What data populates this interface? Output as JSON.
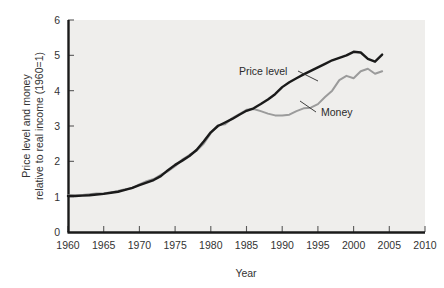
{
  "chart_data": {
    "type": "line",
    "title": "",
    "xlabel": "Year",
    "ylabel": "Price level and money relative to real income (1960=1)",
    "ylabel_line1": "Price level and money",
    "ylabel_line2": "relative to real income (1960=1)",
    "xlim": [
      1960,
      2010
    ],
    "ylim": [
      0,
      6
    ],
    "xticks": [
      1960,
      1965,
      1970,
      1975,
      1980,
      1985,
      1990,
      1995,
      2000,
      2005,
      2010
    ],
    "yticks": [
      0,
      1,
      2,
      3,
      4,
      5,
      6
    ],
    "xtick_labels": [
      "1960",
      "1965",
      "1970",
      "1975",
      "1980",
      "1985",
      "1990",
      "1995",
      "2000",
      "2005",
      "2010"
    ],
    "ytick_labels": [
      "0",
      "1",
      "2",
      "3",
      "4",
      "5",
      "6"
    ],
    "grid": false,
    "legend": "annotations",
    "plot_bgcolor": "#efeeec",
    "series": [
      {
        "name": "Price level",
        "color": "#1a1a1a",
        "x": [
          1960,
          1961,
          1962,
          1963,
          1964,
          1965,
          1966,
          1967,
          1968,
          1969,
          1970,
          1971,
          1972,
          1973,
          1974,
          1975,
          1976,
          1977,
          1978,
          1979,
          1980,
          1981,
          1982,
          1983,
          1984,
          1985,
          1986,
          1987,
          1988,
          1989,
          1990,
          1991,
          1992,
          1993,
          1994,
          1995,
          1996,
          1997,
          1998,
          1999,
          2000,
          2001,
          2002,
          2003,
          2004
        ],
        "values": [
          1.02,
          1.02,
          1.03,
          1.04,
          1.06,
          1.08,
          1.11,
          1.14,
          1.19,
          1.25,
          1.33,
          1.4,
          1.47,
          1.58,
          1.75,
          1.9,
          2.02,
          2.15,
          2.32,
          2.56,
          2.82,
          3.0,
          3.1,
          3.2,
          3.32,
          3.43,
          3.5,
          3.62,
          3.75,
          3.9,
          4.1,
          4.24,
          4.35,
          4.46,
          4.56,
          4.66,
          4.76,
          4.86,
          4.93,
          5.0,
          5.1,
          5.08,
          4.9,
          4.82,
          5.02
        ]
      },
      {
        "name": "Money",
        "color": "#9b9b9b",
        "x": [
          1960,
          1961,
          1962,
          1963,
          1964,
          1965,
          1966,
          1967,
          1968,
          1969,
          1970,
          1971,
          1972,
          1973,
          1974,
          1975,
          1976,
          1977,
          1978,
          1979,
          1980,
          1981,
          1982,
          1983,
          1984,
          1985,
          1986,
          1987,
          1988,
          1989,
          1990,
          1991,
          1992,
          1993,
          1994,
          1995,
          1996,
          1997,
          1998,
          1999,
          2000,
          2001,
          2002,
          2003,
          2004
        ],
        "values": [
          1.04,
          1.03,
          1.05,
          1.07,
          1.09,
          1.1,
          1.12,
          1.16,
          1.21,
          1.24,
          1.35,
          1.44,
          1.5,
          1.62,
          1.72,
          1.86,
          2.05,
          2.18,
          2.3,
          2.5,
          2.8,
          3.02,
          3.05,
          3.22,
          3.34,
          3.46,
          3.48,
          3.42,
          3.35,
          3.3,
          3.3,
          3.32,
          3.42,
          3.5,
          3.52,
          3.62,
          3.82,
          4.0,
          4.3,
          4.42,
          4.35,
          4.55,
          4.62,
          4.48,
          4.55
        ]
      }
    ],
    "annotations": [
      {
        "text": "Price level",
        "x_px": 239,
        "y_px": 75,
        "leader": [
          [
            298,
            71
          ],
          [
            318,
            81
          ]
        ]
      },
      {
        "text": "Money",
        "x_px": 321,
        "y_px": 116,
        "leader": [
          [
            316,
            112
          ],
          [
            300,
            101
          ]
        ]
      }
    ]
  }
}
